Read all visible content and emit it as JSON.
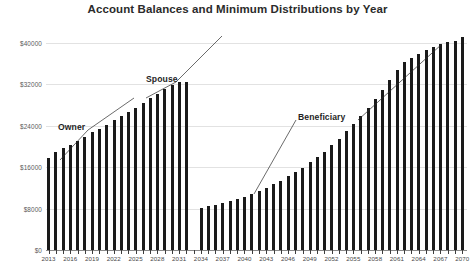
{
  "chart_data": {
    "type": "bar",
    "title": "Account Balances and Minimum Distributions by Year",
    "xlabel": "",
    "ylabel": "",
    "ylim": [
      0,
      44000
    ],
    "yticks": [
      0,
      8000,
      16000,
      24000,
      32000,
      40000
    ],
    "ytick_labels": [
      "$0",
      "$8000",
      "$16000",
      "$24000",
      "$32000",
      "$40000"
    ],
    "grid": true,
    "legend": "none",
    "xlim": [
      2013,
      2071
    ],
    "xtick_step": 3,
    "xtick_labels": [
      "2013",
      "2016",
      "2019",
      "2022",
      "2025",
      "2028",
      "2031",
      "2034",
      "2037",
      "2040",
      "2043",
      "2046",
      "2049",
      "2052",
      "2055",
      "2058",
      "2061",
      "2064",
      "2067",
      "2070"
    ],
    "bar_color": "#1a1a1a",
    "grid_color": "#e2e2e2",
    "categories": [
      2013,
      2014,
      2015,
      2016,
      2017,
      2018,
      2019,
      2020,
      2021,
      2022,
      2023,
      2024,
      2025,
      2026,
      2027,
      2028,
      2029,
      2030,
      2031,
      2032,
      2034,
      2035,
      2036,
      2037,
      2038,
      2039,
      2040,
      2041,
      2042,
      2043,
      2044,
      2045,
      2046,
      2047,
      2048,
      2049,
      2050,
      2051,
      2052,
      2053,
      2054,
      2055,
      2056,
      2057,
      2058,
      2059,
      2060,
      2061,
      2062,
      2063,
      2064,
      2065,
      2066,
      2067,
      2068,
      2069,
      2070
    ],
    "values": [
      17800,
      18900,
      19600,
      20300,
      21100,
      21900,
      22700,
      23400,
      24200,
      25000,
      25800,
      26600,
      27500,
      28400,
      29300,
      30100,
      31000,
      31800,
      32400,
      32500,
      8200,
      8400,
      8700,
      9000,
      9400,
      9800,
      10300,
      10800,
      11400,
      12000,
      12700,
      13400,
      14200,
      15000,
      15900,
      16900,
      17900,
      19000,
      20200,
      21500,
      22900,
      24300,
      25800,
      27400,
      29100,
      30900,
      32800,
      34800,
      36200,
      37100,
      37900,
      38600,
      39200,
      39700,
      40100,
      40400,
      41200
    ],
    "annotations": [
      {
        "label": "Owner",
        "x": 2016,
        "y": 24200
      },
      {
        "label": "Spouse",
        "x": 2026,
        "y": 31800
      },
      {
        "label": "Beneficiary",
        "x": 2047,
        "y": 26600
      }
    ]
  }
}
